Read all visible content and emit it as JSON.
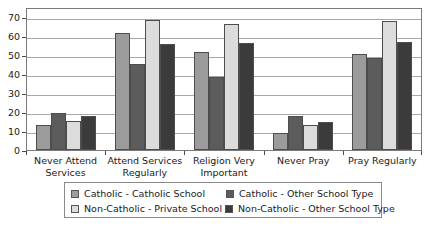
{
  "chart_data": {
    "type": "bar",
    "title": "",
    "xlabel": "",
    "ylabel": "",
    "ylim": [
      0,
      75
    ],
    "yticks": [
      0,
      10,
      20,
      30,
      40,
      50,
      60,
      70
    ],
    "grid": true,
    "legend_position": "bottom",
    "categories": [
      "Never Attend Services",
      "Attend Services Regularly",
      "Religion Very Important",
      "Never Pray",
      "Pray Regularly"
    ],
    "category_lines": [
      [
        "Never Attend",
        "Services"
      ],
      [
        "Attend Services",
        "Regularly"
      ],
      [
        "Religion Very",
        "Important"
      ],
      [
        "Never Pray"
      ],
      [
        "Pray Regularly"
      ]
    ],
    "series": [
      {
        "name": "Catholic - Catholic School",
        "color": "#9b9b9b",
        "values": [
          13,
          61.5,
          51.5,
          9,
          50.5
        ]
      },
      {
        "name": "Catholic - Other School Type",
        "color": "#5c5c5c",
        "values": [
          19.5,
          45,
          38.5,
          18,
          48
        ]
      },
      {
        "name": "Non-Catholic - Private School",
        "color": "#dcdcdc",
        "values": [
          15,
          68,
          66,
          13,
          67.5
        ]
      },
      {
        "name": "Non-Catholic - Other School Type",
        "color": "#3b3b3b",
        "values": [
          18,
          55.5,
          56,
          14.5,
          56.5
        ]
      }
    ]
  },
  "legend": {
    "items": [
      {
        "label": "Catholic - Catholic School",
        "color": "#9b9b9b"
      },
      {
        "label": "Catholic - Other School Type",
        "color": "#5c5c5c"
      },
      {
        "label": "Non-Catholic - Private School",
        "color": "#dcdcdc"
      },
      {
        "label": "Non-Catholic - Other School Type",
        "color": "#3b3b3b"
      }
    ]
  }
}
